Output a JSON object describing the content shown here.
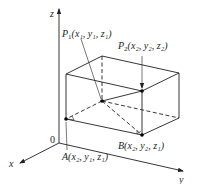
{
  "figure": {
    "type": "3D rectangular box between two points in space",
    "axes": {
      "z_label": "z",
      "x_label": "x",
      "y_label": "y",
      "origin_label": "0"
    },
    "points": {
      "P1": {
        "name": "P",
        "sub": "1",
        "coords_text": "(x₁, y₁, z₁)"
      },
      "P2": {
        "name": "P",
        "sub": "2",
        "coords_text": "(x₂, y₂, z₂)"
      },
      "A": {
        "name": "A",
        "coords_text": "(x₂, y₁, z₁)"
      },
      "B": {
        "name": "B",
        "coords_text": "(x₂, y₂, z₁)"
      }
    },
    "colors": {
      "ink": "#231f20",
      "background": "#ffffff"
    }
  }
}
